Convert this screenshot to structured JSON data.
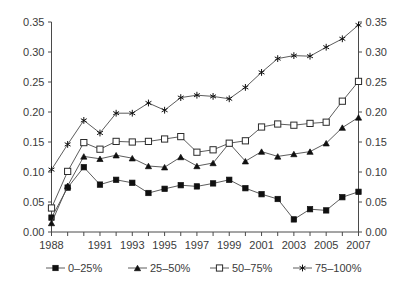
{
  "chart_data": {
    "type": "line",
    "title": "",
    "xlabel": "",
    "ylabel": "",
    "grid": false,
    "legend_position": "bottom",
    "xlim": [
      1988,
      2007
    ],
    "ylim": [
      0.0,
      0.35
    ],
    "y_ticks": [
      "0.00",
      "0.05",
      "0.10",
      "0.15",
      "0.20",
      "0.25",
      "0.30",
      "0.35"
    ],
    "y_tick_values": [
      0.0,
      0.05,
      0.1,
      0.15,
      0.2,
      0.25,
      0.3,
      0.35
    ],
    "dual_y_axis": true,
    "x": [
      1988,
      1989,
      1990,
      1991,
      1992,
      1993,
      1994,
      1995,
      1996,
      1997,
      1998,
      1999,
      2000,
      2001,
      2002,
      2003,
      2004,
      2005,
      2006,
      2007
    ],
    "x_tick_labels": [
      "1988",
      "",
      "",
      "1991",
      "",
      "1993",
      "",
      "1995",
      "",
      "1997",
      "",
      "1999",
      "",
      "2001",
      "",
      "2003",
      "",
      "2005",
      "",
      "2007"
    ],
    "x_major_labels": [
      "1988",
      "1991",
      "1993",
      "1995",
      "1997",
      "1999",
      "2001",
      "2003",
      "2005",
      "2007"
    ],
    "series": [
      {
        "name": "0–25%",
        "marker": "filled-square",
        "values": [
          0.024,
          0.074,
          0.108,
          0.079,
          0.087,
          0.082,
          0.065,
          0.072,
          0.078,
          0.076,
          0.081,
          0.087,
          0.073,
          0.063,
          0.055,
          0.021,
          0.038,
          0.036,
          0.058,
          0.067
        ]
      },
      {
        "name": "25–50%",
        "marker": "filled-triangle",
        "values": [
          0.015,
          0.077,
          0.126,
          0.122,
          0.128,
          0.123,
          0.11,
          0.108,
          0.125,
          0.11,
          0.115,
          0.148,
          0.118,
          0.134,
          0.126,
          0.13,
          0.134,
          0.148,
          0.174,
          0.191
        ]
      },
      {
        "name": "50–75%",
        "marker": "open-square",
        "values": [
          0.04,
          0.101,
          0.149,
          0.138,
          0.151,
          0.15,
          0.151,
          0.155,
          0.159,
          0.133,
          0.137,
          0.148,
          0.152,
          0.175,
          0.18,
          0.178,
          0.181,
          0.183,
          0.218,
          0.251
        ]
      },
      {
        "name": "75–100%",
        "marker": "star",
        "values": [
          0.104,
          0.146,
          0.186,
          0.165,
          0.198,
          0.198,
          0.215,
          0.203,
          0.224,
          0.228,
          0.226,
          0.222,
          0.241,
          0.266,
          0.289,
          0.294,
          0.293,
          0.308,
          0.322,
          0.345
        ]
      }
    ]
  },
  "legend": {
    "items": [
      {
        "label": "0–25%",
        "marker": "filled-square"
      },
      {
        "label": "25–50%",
        "marker": "filled-triangle"
      },
      {
        "label": "50–75%",
        "marker": "open-square"
      },
      {
        "label": "75–100%",
        "marker": "star"
      }
    ]
  },
  "colors": {
    "line": "#4a4a4a",
    "marker_fill": "#101010",
    "marker_open_fill": "#ffffff",
    "text": "#3b3b3b",
    "background": "#ffffff"
  }
}
